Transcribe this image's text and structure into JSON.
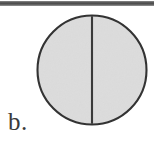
{
  "figure": {
    "panel_label": "b.",
    "top_rule": {
      "name": "horizontal-rule",
      "color": "#4c4c4c"
    },
    "shape": {
      "type": "circle",
      "fill_color": "#dcdcdc",
      "stroke_color": "#333333",
      "stroke_width": 2,
      "center_x": 56,
      "center_y": 56,
      "radius": 55,
      "divider": {
        "name": "vertical-diameter-line",
        "orientation": "vertical",
        "color": "#3a3a3a",
        "width": 2,
        "x": 56,
        "y_start": 1,
        "y_end": 111
      }
    }
  }
}
